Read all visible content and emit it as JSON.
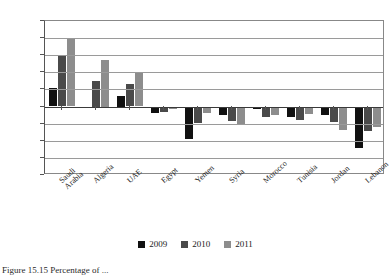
{
  "chart_data": {
    "type": "bar",
    "title": "",
    "xlabel": "",
    "ylabel": "",
    "ylim": [
      -20.0,
      25.0
    ],
    "ytick_step": 5.0,
    "grid": true,
    "legend_position": "bottom",
    "ytick_labels": [
      "25.0",
      "20.0",
      "15.0",
      "10.0",
      "5.0",
      "0.0",
      "-5.0",
      "-10.0",
      "-15.0",
      "-20.0"
    ],
    "ytick_values": [
      25.0,
      20.0,
      15.0,
      10.0,
      5.0,
      0.0,
      -5.0,
      -10.0,
      -15.0,
      -20.0
    ],
    "categories": [
      "Saudi Arabia",
      "Algeria",
      "UAE",
      "Egypt",
      "Yemen",
      "Syria",
      "Morocco",
      "Tunisia",
      "Jordan",
      "Lebanon"
    ],
    "series": [
      {
        "name": "2009",
        "color": "#111111",
        "values": [
          5.5,
          -0.4,
          3.0,
          -1.8,
          -9.5,
          -2.5,
          -0.8,
          -3.0,
          -2.5,
          -12.0
        ]
      },
      {
        "name": "2010",
        "color": "#4a4a4a",
        "values": [
          15.0,
          7.5,
          6.5,
          -1.5,
          -4.8,
          -4.3,
          -3.0,
          -4.0,
          -4.5,
          -7.0
        ]
      },
      {
        "name": "2011",
        "color": "#8d8d8d",
        "values": [
          20.0,
          13.5,
          10.0,
          -0.6,
          -2.0,
          -5.2,
          -2.6,
          -2.2,
          -6.8,
          -6.0
        ]
      }
    ]
  },
  "legend": {
    "items": [
      {
        "label": "2009"
      },
      {
        "label": "2010"
      },
      {
        "label": "2011"
      }
    ]
  },
  "caption": {
    "text": "Figure 15.15 Percentage of ..."
  }
}
